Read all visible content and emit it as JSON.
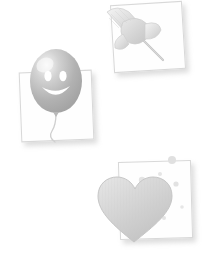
{
  "scene": {
    "title": "Faded sticker cards collage",
    "background_color": "#ffffff",
    "width": 215,
    "height": 262,
    "style": "very light grayscale, washed-out, soft drop shadows"
  },
  "cards": [
    {
      "id": "card-balloon",
      "label": "Balloon card",
      "icon_name": "balloon-smiley-icon",
      "icon_description": "Gray balloon with smiley face and curly string",
      "border_color": "#d8d8d8",
      "fill_color": "#fefefe",
      "shadow_color": "#aaaaaa",
      "rotation_deg": -2.2,
      "x": 20,
      "y": 71,
      "width": 71,
      "height": 68
    },
    {
      "id": "card-pushpin",
      "label": "Pushpin card",
      "icon_name": "pushpin-icon",
      "icon_description": "Gray thumbtack pushpin angled down-right",
      "border_color": "#d8d8d8",
      "fill_color": "#fefefe",
      "shadow_color": "#aaaaaa",
      "rotation_deg": -3.5,
      "x": 112,
      "y": 3,
      "width": 70,
      "height": 66
    },
    {
      "id": "card-heart",
      "label": "Heart card",
      "icon_name": "heart-bubbles-icon",
      "icon_description": "Gray heart with small floating bubbles above it",
      "border_color": "#d8d8d8",
      "fill_color": "#fefefe",
      "shadow_color": "#aaaaaa",
      "rotation_deg": -1.6,
      "x": 119,
      "y": 161,
      "width": 71,
      "height": 76
    }
  ],
  "art": {
    "balloon": {
      "name": "balloon-smiley-icon",
      "body_color": "#b5b5b5",
      "highlight_color": "#f2f2f2",
      "face_color": "#ffffff",
      "string_color": "#cfcfcf"
    },
    "pushpin": {
      "name": "pushpin-icon",
      "body_color": "#dcdcdc",
      "shade_color": "#c9c9c9",
      "needle_color": "#c4c4c4"
    },
    "heart": {
      "name": "heart-bubbles-icon",
      "body_color": "#d9d9d9",
      "edge_color": "#c6c6c6",
      "bubble_color": "#e2e2e2",
      "bubble_count": 9
    }
  }
}
